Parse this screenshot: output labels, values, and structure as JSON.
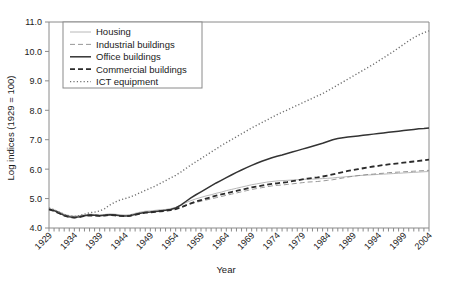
{
  "chart_data": {
    "type": "line",
    "title": "",
    "xlabel": "Year",
    "ylabel": "Log indices (1929 = 100)",
    "xlim": [
      1929,
      2004
    ],
    "ylim": [
      4.0,
      11.0
    ],
    "grid": false,
    "legend_position": "top-left",
    "x_tick_labels": [
      "1929",
      "1934",
      "1939",
      "1944",
      "1949",
      "1954",
      "1959",
      "1964",
      "1969",
      "1974",
      "1979",
      "1984",
      "1989",
      "1994",
      "1999",
      "2004"
    ],
    "y_tick_labels": [
      "4.0",
      "5.0",
      "6.0",
      "7.0",
      "8.0",
      "9.0",
      "10.0",
      "11.0"
    ],
    "x": [
      1929,
      1930,
      1931,
      1932,
      1933,
      1934,
      1935,
      1936,
      1937,
      1938,
      1939,
      1940,
      1941,
      1942,
      1943,
      1944,
      1945,
      1946,
      1947,
      1948,
      1949,
      1950,
      1951,
      1952,
      1953,
      1954,
      1955,
      1956,
      1957,
      1958,
      1959,
      1960,
      1961,
      1962,
      1963,
      1964,
      1965,
      1966,
      1967,
      1968,
      1969,
      1970,
      1971,
      1972,
      1973,
      1974,
      1975,
      1976,
      1977,
      1978,
      1979,
      1980,
      1981,
      1982,
      1983,
      1984,
      1985,
      1986,
      1987,
      1988,
      1989,
      1990,
      1991,
      1992,
      1993,
      1994,
      1995,
      1996,
      1997,
      1998,
      1999,
      2000,
      2001,
      2002,
      2003,
      2004
    ],
    "series": [
      {
        "name": "Housing",
        "style": "thin-solid",
        "color": "#b0b0b0",
        "values": [
          4.66,
          4.62,
          4.55,
          4.47,
          4.42,
          4.4,
          4.42,
          4.45,
          4.47,
          4.46,
          4.45,
          4.46,
          4.48,
          4.47,
          4.45,
          4.44,
          4.45,
          4.5,
          4.54,
          4.57,
          4.58,
          4.6,
          4.62,
          4.63,
          4.66,
          4.7,
          4.78,
          4.86,
          4.93,
          4.99,
          5.04,
          5.09,
          5.13,
          5.18,
          5.22,
          5.27,
          5.31,
          5.35,
          5.39,
          5.43,
          5.47,
          5.5,
          5.53,
          5.56,
          5.58,
          5.6,
          5.61,
          5.62,
          5.63,
          5.64,
          5.65,
          5.66,
          5.66,
          5.67,
          5.68,
          5.69,
          5.7,
          5.72,
          5.73,
          5.75,
          5.76,
          5.78,
          5.79,
          5.8,
          5.81,
          5.82,
          5.83,
          5.84,
          5.85,
          5.86,
          5.87,
          5.88,
          5.89,
          5.9,
          5.91,
          5.92
        ]
      },
      {
        "name": "Industrial buildings",
        "style": "thin-dashed",
        "color": "#8c8c8c",
        "values": [
          4.65,
          4.6,
          4.52,
          4.44,
          4.39,
          4.37,
          4.39,
          4.43,
          4.45,
          4.44,
          4.43,
          4.44,
          4.46,
          4.45,
          4.43,
          4.42,
          4.43,
          4.47,
          4.51,
          4.54,
          4.55,
          4.57,
          4.59,
          4.6,
          4.62,
          4.65,
          4.7,
          4.76,
          4.82,
          4.87,
          4.91,
          4.95,
          4.99,
          5.03,
          5.07,
          5.11,
          5.15,
          5.19,
          5.23,
          5.27,
          5.31,
          5.34,
          5.37,
          5.4,
          5.43,
          5.45,
          5.46,
          5.48,
          5.5,
          5.52,
          5.54,
          5.56,
          5.57,
          5.58,
          5.6,
          5.62,
          5.64,
          5.67,
          5.7,
          5.73,
          5.76,
          5.78,
          5.8,
          5.82,
          5.83,
          5.85,
          5.86,
          5.88,
          5.89,
          5.9,
          5.91,
          5.92,
          5.93,
          5.94,
          5.95,
          5.96
        ]
      },
      {
        "name": "Office buildings",
        "style": "thick-solid",
        "color": "#333333",
        "values": [
          4.64,
          4.59,
          4.51,
          4.43,
          4.38,
          4.36,
          4.38,
          4.42,
          4.44,
          4.43,
          4.42,
          4.43,
          4.45,
          4.44,
          4.42,
          4.41,
          4.42,
          4.46,
          4.5,
          4.53,
          4.54,
          4.56,
          4.58,
          4.6,
          4.63,
          4.68,
          4.78,
          4.9,
          5.02,
          5.13,
          5.23,
          5.33,
          5.43,
          5.53,
          5.62,
          5.71,
          5.8,
          5.89,
          5.97,
          6.05,
          6.13,
          6.2,
          6.27,
          6.33,
          6.39,
          6.44,
          6.48,
          6.53,
          6.58,
          6.63,
          6.68,
          6.73,
          6.78,
          6.83,
          6.88,
          6.94,
          7.0,
          7.04,
          7.07,
          7.09,
          7.11,
          7.13,
          7.15,
          7.17,
          7.19,
          7.21,
          7.23,
          7.25,
          7.27,
          7.29,
          7.31,
          7.33,
          7.35,
          7.37,
          7.38,
          7.4
        ]
      },
      {
        "name": "Commercial buildings",
        "style": "thick-dashed",
        "color": "#2b2b2b",
        "values": [
          4.63,
          4.58,
          4.5,
          4.42,
          4.37,
          4.35,
          4.37,
          4.41,
          4.43,
          4.42,
          4.41,
          4.42,
          4.44,
          4.43,
          4.41,
          4.4,
          4.41,
          4.45,
          4.49,
          4.52,
          4.53,
          4.55,
          4.57,
          4.58,
          4.61,
          4.64,
          4.7,
          4.77,
          4.84,
          4.9,
          4.95,
          5.0,
          5.05,
          5.1,
          5.14,
          5.18,
          5.22,
          5.26,
          5.3,
          5.34,
          5.38,
          5.41,
          5.44,
          5.47,
          5.5,
          5.52,
          5.54,
          5.56,
          5.59,
          5.62,
          5.65,
          5.68,
          5.7,
          5.72,
          5.75,
          5.78,
          5.82,
          5.86,
          5.9,
          5.94,
          5.97,
          6.0,
          6.03,
          6.06,
          6.09,
          6.11,
          6.14,
          6.16,
          6.18,
          6.2,
          6.22,
          6.24,
          6.26,
          6.28,
          6.3,
          6.32
        ]
      },
      {
        "name": "ICT equipment",
        "style": "dotted",
        "color": "#707070",
        "values": [
          4.68,
          4.62,
          4.54,
          4.46,
          4.41,
          4.39,
          4.42,
          4.47,
          4.52,
          4.54,
          4.58,
          4.66,
          4.78,
          4.88,
          4.95,
          5.0,
          5.05,
          5.12,
          5.2,
          5.28,
          5.35,
          5.43,
          5.52,
          5.61,
          5.7,
          5.79,
          5.9,
          6.02,
          6.14,
          6.25,
          6.36,
          6.47,
          6.58,
          6.69,
          6.8,
          6.9,
          7.0,
          7.1,
          7.2,
          7.3,
          7.4,
          7.49,
          7.58,
          7.67,
          7.76,
          7.85,
          7.93,
          8.01,
          8.09,
          8.17,
          8.25,
          8.33,
          8.41,
          8.49,
          8.57,
          8.66,
          8.76,
          8.86,
          8.96,
          9.06,
          9.16,
          9.26,
          9.36,
          9.46,
          9.56,
          9.67,
          9.78,
          9.89,
          10.0,
          10.12,
          10.24,
          10.36,
          10.47,
          10.56,
          10.64,
          10.7
        ]
      }
    ]
  }
}
